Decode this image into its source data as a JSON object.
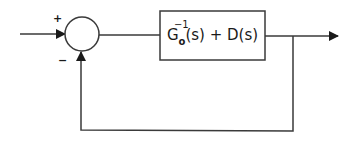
{
  "diagram": {
    "type": "feedback-control-block-diagram",
    "summing_junction": {
      "plus_sign": "+",
      "minus_sign": "−"
    },
    "block": {
      "base": "G",
      "superscript": "−1",
      "subscript": "o",
      "rest": "(s) + D(s)",
      "full_label": "G_o^{-1}(s) + D(s)"
    },
    "colors": {
      "stroke": "#3a3a3a",
      "background": "#ffffff"
    }
  }
}
